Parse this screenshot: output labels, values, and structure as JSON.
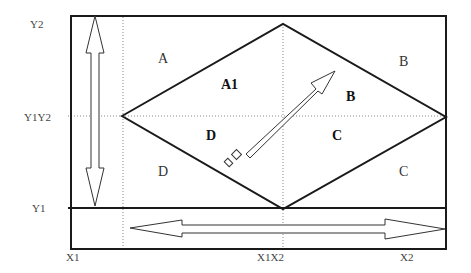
{
  "diagram": {
    "type": "diamond-region-partition",
    "axis_labels": {
      "y2": "Y2",
      "y1y2": "Y1Y2",
      "y1": "Y1",
      "x1": "X1",
      "x1x2": "X1X2",
      "x2": "X2"
    },
    "outer_regions": {
      "top_left": "A",
      "top_right": "B",
      "bottom_left": "D",
      "bottom_right": "C"
    },
    "inner_regions": {
      "top_left": "A1",
      "top_right": "B",
      "bottom_left": "D",
      "bottom_right": "C"
    },
    "arrows": [
      {
        "name": "vertical-double-arrow",
        "direction": "up-down"
      },
      {
        "name": "horizontal-double-arrow",
        "direction": "left-right"
      },
      {
        "name": "diagonal-arrow",
        "direction": "toward top-right (B)"
      }
    ],
    "colors": {
      "line": "#1a1a1a",
      "dotted": "#888888",
      "background": "#ffffff"
    }
  }
}
